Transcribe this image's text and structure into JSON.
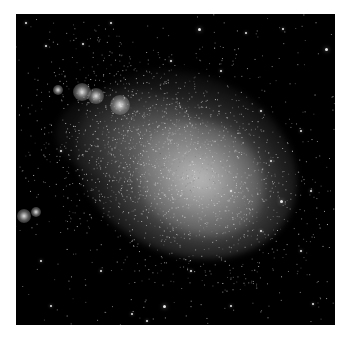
{
  "image": {
    "subject": "dwarf galaxy star field",
    "background_color": "#000000",
    "page_color": "#ffffff",
    "cloud_color": "#a8a8a8"
  },
  "knots": [
    {
      "x": 82,
      "y": 92,
      "r": 9
    },
    {
      "x": 96,
      "y": 96,
      "r": 8
    },
    {
      "x": 120,
      "y": 105,
      "r": 10
    },
    {
      "x": 58,
      "y": 90,
      "r": 5
    },
    {
      "x": 24,
      "y": 216,
      "r": 7
    },
    {
      "x": 36,
      "y": 212,
      "r": 5
    }
  ],
  "stars": [
    {
      "x": 198,
      "y": 28,
      "s": 3
    },
    {
      "x": 245,
      "y": 32,
      "s": 2
    },
    {
      "x": 282,
      "y": 28,
      "s": 2
    },
    {
      "x": 25,
      "y": 22,
      "s": 2
    },
    {
      "x": 110,
      "y": 22,
      "s": 2
    },
    {
      "x": 325,
      "y": 48,
      "s": 3
    },
    {
      "x": 45,
      "y": 45,
      "s": 2
    },
    {
      "x": 82,
      "y": 43,
      "s": 2
    },
    {
      "x": 300,
      "y": 130,
      "s": 2
    },
    {
      "x": 280,
      "y": 200,
      "s": 3
    },
    {
      "x": 260,
      "y": 230,
      "s": 2
    },
    {
      "x": 163,
      "y": 305,
      "s": 3
    },
    {
      "x": 146,
      "y": 320,
      "s": 2
    },
    {
      "x": 230,
      "y": 305,
      "s": 2
    },
    {
      "x": 50,
      "y": 305,
      "s": 2
    },
    {
      "x": 312,
      "y": 303,
      "s": 2
    },
    {
      "x": 131,
      "y": 313,
      "s": 2
    },
    {
      "x": 300,
      "y": 250,
      "s": 2
    },
    {
      "x": 220,
      "y": 70,
      "s": 2
    },
    {
      "x": 170,
      "y": 60,
      "s": 2
    },
    {
      "x": 60,
      "y": 150,
      "s": 2
    },
    {
      "x": 40,
      "y": 260,
      "s": 2
    },
    {
      "x": 100,
      "y": 270,
      "s": 2
    },
    {
      "x": 270,
      "y": 160,
      "s": 2
    },
    {
      "x": 310,
      "y": 190,
      "s": 2
    },
    {
      "x": 190,
      "y": 270,
      "s": 2
    },
    {
      "x": 230,
      "y": 190,
      "s": 2
    },
    {
      "x": 260,
      "y": 110,
      "s": 2
    }
  ],
  "grain": {
    "count": 2200,
    "seed": 7
  }
}
